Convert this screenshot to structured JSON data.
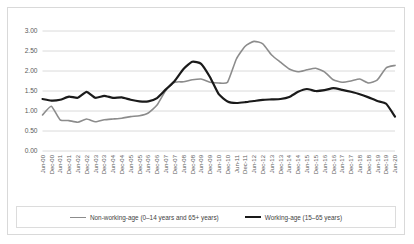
{
  "chart_data": {
    "type": "line",
    "title": "",
    "xlabel": "",
    "ylabel": "",
    "ylim": [
      0.0,
      3.0
    ],
    "ytick_labels": [
      "0.00",
      "0.50",
      "1.00",
      "1.50",
      "2.00",
      "2.50",
      "3.00"
    ],
    "ytick_values": [
      0.0,
      0.5,
      1.0,
      1.5,
      2.0,
      2.5,
      3.0
    ],
    "grid": true,
    "legend_position": "bottom",
    "x": [
      "Jun-00",
      "Dec-00",
      "Jun-01",
      "Dec-01",
      "Jun-02",
      "Dec-02",
      "Jun-03",
      "Dec-03",
      "Jun-04",
      "Dec-04",
      "Jun-05",
      "Dec-05",
      "Jun-06",
      "Dec-06",
      "Jun-07",
      "Dec-07",
      "Jun-08",
      "Dec-08",
      "Jun-09",
      "Dec-09",
      "Jun-10",
      "Dec-10",
      "Jun-11",
      "Dec-11",
      "Jun-12",
      "Dec-12",
      "Jun-13",
      "Dec-13",
      "Jun-14",
      "Dec-14",
      "Jun-15",
      "Dec-15",
      "Jun-16",
      "Dec-16",
      "Jun-17",
      "Dec-17",
      "Jun-18",
      "Dec-18",
      "Jun-19",
      "Dec-19",
      "Jun-20"
    ],
    "series": [
      {
        "name": "Non-working-age (0–14 years and 65+ years)",
        "color": "#8c8c8c",
        "width": 1.6,
        "values": [
          0.9,
          1.12,
          0.78,
          0.76,
          0.72,
          0.8,
          0.73,
          0.78,
          0.8,
          0.82,
          0.86,
          0.88,
          0.95,
          1.15,
          1.52,
          1.72,
          1.73,
          1.78,
          1.8,
          1.72,
          1.7,
          1.72,
          2.3,
          2.62,
          2.74,
          2.68,
          2.4,
          2.22,
          2.05,
          1.98,
          2.03,
          2.07,
          1.98,
          1.78,
          1.72,
          1.75,
          1.8,
          1.7,
          1.78,
          2.08,
          2.14
        ]
      },
      {
        "name": "Working-age (15–65 years)",
        "color": "#1a1a1a",
        "width": 2.2,
        "values": [
          1.3,
          1.26,
          1.28,
          1.36,
          1.33,
          1.48,
          1.33,
          1.38,
          1.33,
          1.34,
          1.28,
          1.24,
          1.24,
          1.32,
          1.54,
          1.75,
          2.05,
          2.23,
          2.18,
          1.85,
          1.42,
          1.24,
          1.2,
          1.22,
          1.25,
          1.28,
          1.29,
          1.3,
          1.35,
          1.48,
          1.55,
          1.5,
          1.52,
          1.57,
          1.53,
          1.48,
          1.42,
          1.34,
          1.25,
          1.18,
          0.86
        ]
      }
    ]
  },
  "legend": {
    "items": [
      {
        "label": "Non-working-age (0–14 years and 65+ years)",
        "color": "#8c8c8c"
      },
      {
        "label": "Working-age (15–65 years)",
        "color": "#1a1a1a"
      }
    ]
  }
}
